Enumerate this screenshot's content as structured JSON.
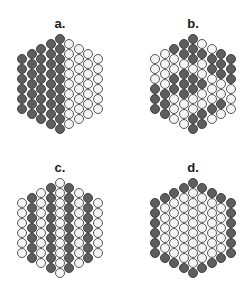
{
  "figure": {
    "colors": {
      "dark": "#5e5e5e",
      "light": "#f4f4f4",
      "outline": "#404040"
    },
    "column_counts": [
      6,
      7,
      8,
      9,
      10,
      9,
      8,
      7,
      6
    ],
    "panels": [
      {
        "id": "a",
        "label": "a.",
        "cx": 60,
        "top": 34,
        "label_y": 17,
        "columns": [
          "DDDDDD",
          "DDDDDDD",
          "DDDDDDDD",
          "DDDDDDDDD",
          "DDDDDDDDDD",
          "WWWWWWWWW",
          "WWWWWWWW",
          "WWWWWWW",
          "WWWWWW"
        ]
      },
      {
        "id": "b",
        "label": "b.",
        "cx": 193,
        "top": 34,
        "label_y": 17,
        "columns": [
          "WWWDDD",
          "WWWWDDD",
          "DWWDDWWW",
          "DDWDDDWWW",
          "DDDWDDWWDD",
          "WDWWDWWDD",
          "WDDWWWDW",
          "DDDWWDW",
          "DDDWWW"
        ]
      },
      {
        "id": "c",
        "label": "c.",
        "cx": 60,
        "top": 178,
        "label_y": 161,
        "columns": [
          "WWWWWW",
          "DDDDDDD",
          "WWWWWWWW",
          "DDDDDDDDD",
          "WWWWWWWWWW",
          "DDDDDDDDD",
          "WWWWWWWW",
          "DDDDDDD",
          "WWWWWW"
        ]
      },
      {
        "id": "d",
        "label": "d.",
        "cx": 193,
        "top": 178,
        "label_y": 161,
        "columns": [
          "DDDDDD",
          "DWWWWWD",
          "DWWWWWWD",
          "DWWWWWWWD",
          "DWWWWWWWWD",
          "DWWWWWWWD",
          "DWWWWWWD",
          "DWWWWWD",
          "DDDDDD"
        ]
      }
    ]
  }
}
